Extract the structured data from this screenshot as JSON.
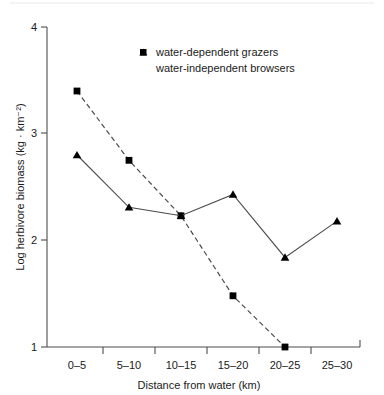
{
  "chart_data": {
    "type": "line",
    "title": "",
    "xlabel": "Distance from water (km)",
    "ylabel": "Log herbivore biomass (kg · km⁻²)",
    "categories": [
      "0–5",
      "5–10",
      "10–15",
      "15–20",
      "20–25",
      "25–30"
    ],
    "ylim": [
      1,
      4
    ],
    "yticks": [
      "1",
      "2",
      "3",
      "4"
    ],
    "ytick_values": [
      1,
      2,
      3,
      4
    ],
    "grid": false,
    "legend_position": "top-center",
    "series": [
      {
        "name": "water-dependent grazers",
        "marker": "square",
        "linestyle": "dashed",
        "color": "#000000",
        "values": [
          3.4,
          2.75,
          2.23,
          1.48,
          1.0,
          null
        ]
      },
      {
        "name": "water-independent browsers",
        "marker": "triangle",
        "linestyle": "solid",
        "color": "#000000",
        "values": [
          2.8,
          2.31,
          2.23,
          2.43,
          1.84,
          2.18
        ]
      }
    ]
  },
  "legend": {
    "items": [
      {
        "label": "water-dependent grazers",
        "marker": "square"
      },
      {
        "label": "water-independent browsers",
        "marker": "triangle"
      }
    ]
  },
  "axes": {
    "y_title": "Log herbivore biomass (kg · km⁻²)",
    "x_title": "Distance from water (km)",
    "y_tick_labels": [
      "4",
      "3",
      "2",
      "1"
    ],
    "x_tick_labels": [
      "0–5",
      "5–10",
      "10–15",
      "15–20",
      "20–25",
      "25–30"
    ]
  }
}
